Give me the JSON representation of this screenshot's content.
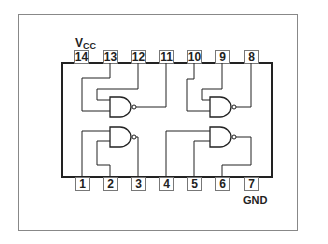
{
  "diagram": {
    "type": "ic-pinout",
    "power_label": {
      "main": "V",
      "sub": "CC"
    },
    "ground_label": "GND",
    "top_pins": [
      "14",
      "13",
      "12",
      "11",
      "10",
      "9",
      "8"
    ],
    "bottom_pins": [
      "1",
      "2",
      "3",
      "4",
      "5",
      "6",
      "7"
    ],
    "gates": [
      {
        "type": "NAND",
        "inputs": [
          "13",
          "12"
        ],
        "output": "11"
      },
      {
        "type": "NAND",
        "inputs": [
          "10",
          "9"
        ],
        "output": "8"
      },
      {
        "type": "NAND",
        "inputs": [
          "1",
          "2"
        ],
        "output": "3"
      },
      {
        "type": "NAND",
        "inputs": [
          "4",
          "5"
        ],
        "output": "6"
      }
    ],
    "colors": {
      "line": "#222222",
      "frame": "#888888",
      "background": "#ffffff"
    }
  }
}
